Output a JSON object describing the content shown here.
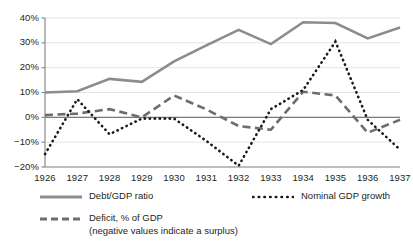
{
  "chart_data": {
    "type": "line",
    "title": "",
    "subtitle": "",
    "xlabel": "",
    "ylabel": "",
    "x": [
      1926,
      1927,
      1928,
      1929,
      1930,
      1931,
      1932,
      1933,
      1934,
      1935,
      1936,
      1937
    ],
    "categories": [
      "1926",
      "1927",
      "1928",
      "1929",
      "1930",
      "1931",
      "1932",
      "1933",
      "1934",
      "1935",
      "1936",
      "1937"
    ],
    "xlim": [
      1926,
      1937
    ],
    "ylim": [
      -20,
      40
    ],
    "yticks": [
      -20,
      -10,
      0,
      10,
      20,
      30,
      40
    ],
    "ytick_labels": [
      "−20%",
      "−10%",
      "0%",
      "10%",
      "20%",
      "30%",
      "40%"
    ],
    "xtick_labels": [
      "1926",
      "1927",
      "1928",
      "1929",
      "1930",
      "1931",
      "1932",
      "1933",
      "1934",
      "1935",
      "1936",
      "1937"
    ],
    "grid": true,
    "grid_axis": "y",
    "legend_position": "bottom",
    "zero_line": true,
    "series": [
      {
        "name": "Debt/GDP ratio",
        "style": "solid",
        "color": "#8c8c8c",
        "values": [
          10.0,
          10.5,
          15.5,
          14.3,
          22.5,
          29.0,
          35.2,
          29.5,
          38.3,
          38.0,
          31.8,
          36.2
        ]
      },
      {
        "name": "Deficit, % of GDP",
        "style": "dashed",
        "color": "#6d6d6d",
        "values": [
          0.9,
          1.5,
          3.3,
          0.0,
          8.8,
          3.2,
          -3.5,
          -5.0,
          10.3,
          8.8,
          -6.2,
          -1.0
        ]
      },
      {
        "name": "Nominal GDP growth",
        "style": "dotted",
        "color": "#1a1a1a",
        "values": [
          -14.8,
          7.3,
          -6.8,
          -0.5,
          -0.5,
          -9.5,
          -19.5,
          3.3,
          11.0,
          30.5,
          -1.0,
          -13.0
        ]
      }
    ]
  },
  "legend": {
    "debt": {
      "label": "Debt/GDP ratio",
      "marker": "solid-line-marker"
    },
    "deficit": {
      "label": "Deficit, % of GDP",
      "sublabel": "(negative values indicate a surplus)",
      "marker": "dashed-line-marker"
    },
    "nominal": {
      "label": "Nominal GDP growth",
      "marker": "dotted-line-marker"
    }
  },
  "colors": {
    "debt_line": "#8c8c8c",
    "deficit_line": "#6d6d6d",
    "nominal_line": "#1a1a1a",
    "grid": "#e3e3e3",
    "axis": "#8a8a8a",
    "zero_line": "#7a7a7a",
    "text": "#231f20"
  }
}
